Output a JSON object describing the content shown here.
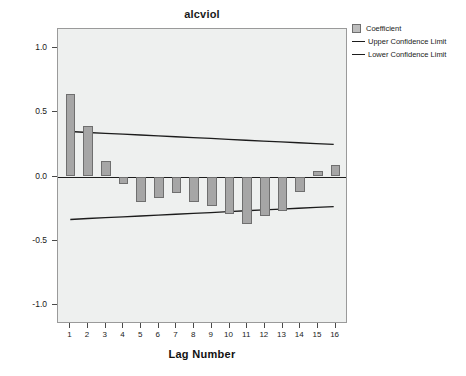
{
  "chart_data": {
    "type": "bar",
    "title": "alcviol",
    "xlabel": "Lag Number",
    "ylabel": "ACF",
    "categories": [
      1,
      2,
      3,
      4,
      5,
      6,
      7,
      8,
      9,
      10,
      11,
      12,
      13,
      14,
      15,
      16
    ],
    "xtick_labels": [
      "1",
      "2",
      "3",
      "4",
      "5",
      "6",
      "7",
      "8",
      "9",
      "10",
      "11",
      "12",
      "13",
      "14",
      "15",
      "16"
    ],
    "values": [
      0.64,
      0.39,
      0.12,
      -0.06,
      -0.2,
      -0.17,
      -0.13,
      -0.2,
      -0.23,
      -0.29,
      -0.37,
      -0.31,
      -0.27,
      -0.12,
      0.04,
      0.09
    ],
    "ylim": [
      -1.15,
      1.15
    ],
    "xlim": [
      0.3,
      16.7
    ],
    "yticks": [
      1.0,
      0.5,
      0.0,
      -0.5,
      -1.0
    ],
    "ytick_labels": [
      "1.0",
      "0.5",
      "0.0",
      "-0.5",
      "-1.0"
    ],
    "grid": false,
    "legend_position": "top-right",
    "series": [
      {
        "name": "Coefficient",
        "kind": "bar",
        "values": [
          0.64,
          0.39,
          0.12,
          -0.06,
          -0.2,
          -0.17,
          -0.13,
          -0.2,
          -0.23,
          -0.29,
          -0.37,
          -0.31,
          -0.27,
          -0.12,
          0.04,
          0.09
        ]
      },
      {
        "name": "Upper Confidence Limit",
        "kind": "line",
        "values": [
          0.345,
          0.338,
          0.331,
          0.325,
          0.318,
          0.311,
          0.304,
          0.297,
          0.291,
          0.284,
          0.277,
          0.27,
          0.264,
          0.257,
          0.25,
          0.244
        ]
      },
      {
        "name": "Lower Confidence Limit",
        "kind": "line",
        "values": [
          -0.345,
          -0.338,
          -0.331,
          -0.325,
          -0.318,
          -0.311,
          -0.304,
          -0.297,
          -0.291,
          -0.284,
          -0.277,
          -0.27,
          -0.264,
          -0.257,
          -0.25,
          -0.244
        ]
      }
    ]
  },
  "legend": {
    "items": [
      {
        "label": "Coefficient",
        "marker": "swatch",
        "color": "#bdbdbd"
      },
      {
        "label": "Upper Confidence Limit",
        "marker": "line",
        "color": "#1c1c1c"
      },
      {
        "label": "Lower Confidence Limit",
        "marker": "line",
        "color": "#1c1c1c"
      }
    ]
  },
  "colors": {
    "bar_fill": "#a6a6a6",
    "bar_stroke": "#6f6f6f",
    "plot_background": "#eef0ef",
    "axis": "#1c1c1c",
    "limit_line": "#1c1c1c"
  }
}
